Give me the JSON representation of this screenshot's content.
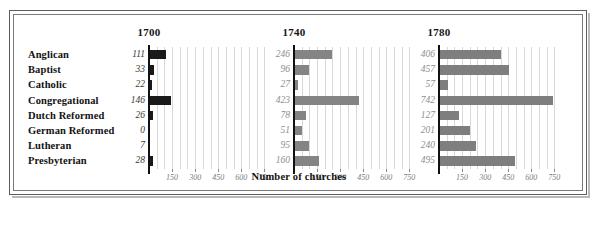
{
  "chart_data": {
    "type": "bar",
    "title": "",
    "xlabel": "Number of churches",
    "ylabel": "",
    "orientation": "horizontal",
    "layout": "small-multiples",
    "grid": true,
    "legend": "none",
    "xlim": [
      0,
      800
    ],
    "xticks": [
      150,
      300,
      450,
      600,
      750
    ],
    "xtick_labels": [
      "150",
      "300",
      "450",
      "600",
      "750"
    ],
    "gridline_step": 50,
    "categories": [
      "Anglican",
      "Baptist",
      "Catholic",
      "Congregational",
      "Dutch Reformed",
      "German Reformed",
      "Lutheran",
      "Presbyterian"
    ],
    "panels": [
      {
        "title": "1700",
        "bar_color": "#1a1a1a",
        "value_color": "#3a3a3a",
        "values": [
          111,
          33,
          22,
          146,
          26,
          0,
          7,
          28
        ],
        "value_labels": [
          "111",
          "33",
          "22",
          "146",
          "26",
          "0",
          "7",
          "28"
        ]
      },
      {
        "title": "1740",
        "bar_color": "#848484",
        "value_color": "#8e8e8e",
        "values": [
          246,
          96,
          27,
          423,
          78,
          51,
          95,
          160
        ],
        "value_labels": [
          "246",
          "96",
          "27",
          "423",
          "78",
          "51",
          "95",
          "160"
        ]
      },
      {
        "title": "1780",
        "bar_color": "#7e7e7e",
        "value_color": "#8e8e8e",
        "values": [
          406,
          457,
          57,
          742,
          127,
          201,
          240,
          495
        ],
        "value_labels": [
          "406",
          "457",
          "57",
          "742",
          "127",
          "201",
          "240",
          "495"
        ]
      }
    ]
  },
  "colors": {
    "frame_outer": "#5d5d5d",
    "frame_inner": "#7a7a7a",
    "gridline": "#d8d8d8",
    "axis": "#111111",
    "background": "#ffffff",
    "row_label": "#121212"
  }
}
